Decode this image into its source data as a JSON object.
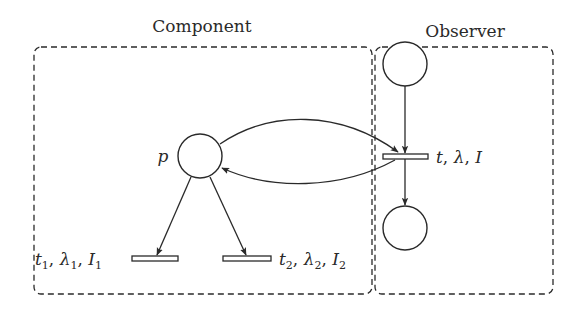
{
  "diagram": {
    "type": "petri-net",
    "groups": [
      {
        "id": "component",
        "label": "Component"
      },
      {
        "id": "observer",
        "label": "Observer"
      }
    ],
    "places": [
      {
        "id": "p",
        "label": "p",
        "group": "component"
      },
      {
        "id": "obs_in",
        "label": "",
        "group": "observer"
      },
      {
        "id": "obs_out",
        "label": "",
        "group": "observer"
      }
    ],
    "transitions": [
      {
        "id": "t1",
        "label": "t₁, λ₁, I₁",
        "group": "component"
      },
      {
        "id": "t2",
        "label": "t₂, λ₂, I₂",
        "group": "component"
      },
      {
        "id": "t",
        "label": "t, λ, I",
        "group": "observer"
      }
    ],
    "arcs": [
      {
        "from": "p",
        "to": "t1"
      },
      {
        "from": "p",
        "to": "t2"
      },
      {
        "from": "p",
        "to": "t"
      },
      {
        "from": "t",
        "to": "p"
      },
      {
        "from": "obs_in",
        "to": "t"
      },
      {
        "from": "t",
        "to": "obs_out"
      }
    ]
  },
  "labels": {
    "component": "Component",
    "observer": "Observer",
    "p": "p",
    "t1_t": "t",
    "t1_sub": "1",
    "t1_lambda": "λ",
    "t1_lsub": "1",
    "t1_I": "I",
    "t1_isub": "1",
    "t2_t": "t",
    "t2_sub": "2",
    "t2_lambda": "λ",
    "t2_lsub": "2",
    "t2_I": "I",
    "t2_isub": "2",
    "t_t": "t",
    "t_lambda": "λ",
    "t_I": "I",
    "comma": ", "
  },
  "colors": {
    "stroke": "#2a2a2a",
    "background": "#ffffff"
  }
}
